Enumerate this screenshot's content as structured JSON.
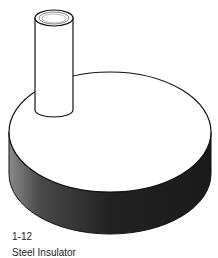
{
  "figure": {
    "colors": {
      "background": "#ffffff",
      "outline": "#111111",
      "disc_side_dark": "#1e1e1e",
      "disc_side_light": "#8a8a8a",
      "top_face": "#ffffff"
    }
  },
  "caption": {
    "number": "1-12",
    "title": "Steel Insulator"
  }
}
